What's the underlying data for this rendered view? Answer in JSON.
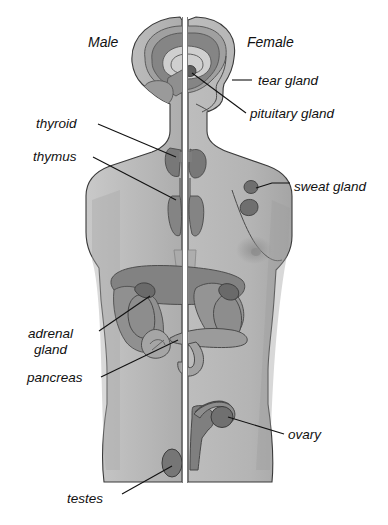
{
  "diagram": {
    "type": "anatomical-illustration",
    "background_color": "#ffffff",
    "ink_color": "#111111"
  },
  "palette": {
    "body_fill": "#b9b9b9",
    "body_fill_light": "#c6c6c6",
    "skin_shadow": "#a8a8a8",
    "organ_mid": "#9a9a9a",
    "organ_dark": "#7e7e7e",
    "organ_darker": "#6d6d6d",
    "gland_dark": "#6a6a6a",
    "outline": "#3a3a3a",
    "divider": "#ffffff"
  },
  "sides": {
    "left_label": "Male",
    "right_label": "Female"
  },
  "labels": [
    {
      "id": "tear-gland",
      "text": "tear gland",
      "side": "right",
      "text_x": 258,
      "text_y": 85,
      "leader": "M 232 80 L 252 80"
    },
    {
      "id": "pituitary-gland",
      "text": "pituitary gland",
      "side": "right",
      "text_x": 250,
      "text_y": 118,
      "leader": "M 190 72 L 244 114"
    },
    {
      "id": "thyroid",
      "text": "thyroid",
      "side": "left",
      "text_x": 36,
      "text_y": 128,
      "leader": "M 96 124 L 178 156"
    },
    {
      "id": "thymus",
      "text": "thymus",
      "side": "left",
      "text_x": 33,
      "text_y": 160,
      "leader": "M 91 157 L 178 199"
    },
    {
      "id": "sweat-gland",
      "text": "sweat gland",
      "side": "right",
      "text_x": 294,
      "text_y": 191,
      "leader": "M 254 189 L 272 185 L 288 185"
    },
    {
      "id": "adrenal-gland",
      "text": "adrenal",
      "text_line2": "gland",
      "side": "left",
      "text_x": 28,
      "text_y": 337,
      "text2_x": 34,
      "text2_y": 353,
      "leader": "M 97 331 L 150 297"
    },
    {
      "id": "pancreas",
      "text": "pancreas",
      "side": "left",
      "text_x": 27,
      "text_y": 381,
      "leader": "M 99 377 L 176 339"
    },
    {
      "id": "ovary",
      "text": "ovary",
      "side": "right",
      "text_x": 288,
      "text_y": 438,
      "leader": "M 226 416 L 282 434"
    },
    {
      "id": "testes",
      "text": "testes",
      "side": "left",
      "text_x": 67,
      "text_y": 502,
      "leader": "M 120 494 L 172 464"
    }
  ],
  "organs": [
    {
      "id": "brain-cerebrum",
      "name": "cerebrum",
      "side": "both"
    },
    {
      "id": "brain-cortex",
      "name": "cerebral cortex",
      "side": "both"
    },
    {
      "id": "corpus-callosum",
      "name": "corpus callosum",
      "side": "both"
    },
    {
      "id": "cerebellum",
      "name": "cerebellum",
      "side": "left"
    },
    {
      "id": "pituitary",
      "name": "pituitary gland",
      "side": "right"
    },
    {
      "id": "thyroid",
      "name": "thyroid",
      "side": "both"
    },
    {
      "id": "thymus",
      "name": "thymus",
      "side": "both"
    },
    {
      "id": "sweat-gland",
      "name": "sweat gland",
      "side": "right"
    },
    {
      "id": "breast",
      "name": "breast",
      "side": "right"
    },
    {
      "id": "liver",
      "name": "liver",
      "side": "both"
    },
    {
      "id": "stomach",
      "name": "stomach",
      "side": "right"
    },
    {
      "id": "kidney",
      "name": "kidney",
      "side": "both"
    },
    {
      "id": "adrenal",
      "name": "adrenal gland",
      "side": "both"
    },
    {
      "id": "pancreas",
      "name": "pancreas",
      "side": "both"
    },
    {
      "id": "duodenum",
      "name": "duodenum",
      "side": "right"
    },
    {
      "id": "uterus",
      "name": "uterus",
      "side": "right"
    },
    {
      "id": "fallopian-tube",
      "name": "fallopian tube",
      "side": "right"
    },
    {
      "id": "ovary",
      "name": "ovary",
      "side": "right"
    },
    {
      "id": "testis",
      "name": "testis",
      "side": "left"
    }
  ]
}
